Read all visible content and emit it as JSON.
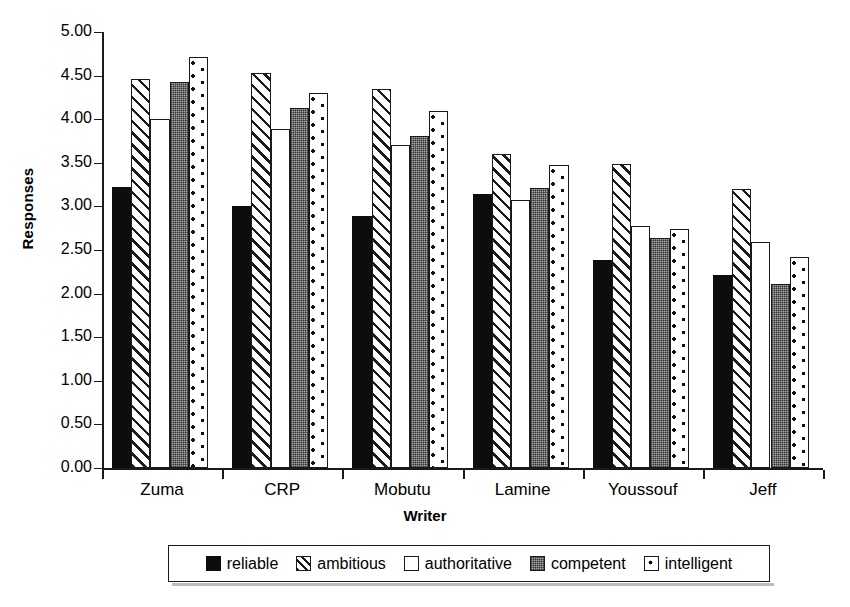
{
  "chart_data": {
    "type": "bar",
    "title": "",
    "xlabel": "Writer",
    "ylabel": "Responses",
    "ylim": [
      0,
      5
    ],
    "ytick_step": 0.5,
    "ytick_labels": [
      "0.00",
      "0.50",
      "1.00",
      "1.50",
      "2.00",
      "2.50",
      "3.00",
      "3.50",
      "4.00",
      "4.50",
      "5.00"
    ],
    "grid": false,
    "legend_position": "bottom",
    "categories": [
      "Zuma",
      "CRP",
      "Mobutu",
      "Lamine",
      "Youssouf",
      "Jeff"
    ],
    "series": [
      {
        "name": "reliable",
        "pattern": "solid-black",
        "values": [
          3.22,
          3.0,
          2.89,
          3.14,
          2.39,
          2.21
        ]
      },
      {
        "name": "ambitious",
        "pattern": "diagonal-hatch",
        "values": [
          4.46,
          4.53,
          4.35,
          3.6,
          3.49,
          3.2
        ]
      },
      {
        "name": "authoritative",
        "pattern": "open-white",
        "values": [
          4.0,
          3.89,
          3.7,
          3.07,
          2.78,
          2.59
        ]
      },
      {
        "name": "competent",
        "pattern": "gray-fill",
        "values": [
          4.43,
          4.13,
          3.81,
          3.21,
          2.64,
          2.11
        ]
      },
      {
        "name": "intelligent",
        "pattern": "dotted-white",
        "values": [
          4.71,
          4.3,
          4.09,
          3.48,
          2.74,
          2.42
        ]
      }
    ]
  },
  "legend": {
    "items": [
      {
        "label": "reliable"
      },
      {
        "label": "ambitious"
      },
      {
        "label": "authoritative"
      },
      {
        "label": "competent"
      },
      {
        "label": "intelligent"
      }
    ]
  },
  "colors": {
    "axis": "#1a1a1a",
    "reliable": "#0d0d0d",
    "competent_gray": "#a8a8a8",
    "background": "#ffffff"
  }
}
